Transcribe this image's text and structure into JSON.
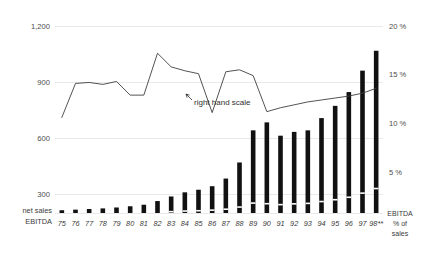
{
  "chart_data": {
    "type": "bar",
    "title": "",
    "subtitle": "",
    "xlabel": "",
    "ylabel": "",
    "grid": true,
    "legend_position": "inline-left-and-right",
    "categories": [
      "75",
      "76",
      "77",
      "78",
      "79",
      "80",
      "81",
      "82",
      "83",
      "84",
      "85",
      "86",
      "87",
      "88",
      "89",
      "90",
      "91",
      "92",
      "93",
      "94",
      "95",
      "96",
      "97",
      "98**"
    ],
    "left_axis": {
      "label": "net sales",
      "ticks": [
        "300",
        "600",
        "900",
        "1,200"
      ],
      "tick_values": [
        300,
        600,
        900,
        1200
      ],
      "ylim": [
        0,
        1300
      ]
    },
    "right_axis": {
      "label": "EBITDA % of sales",
      "label_lines": [
        "EBITDA",
        "% of",
        "sales"
      ],
      "ticks": [
        "5 %",
        "10 %",
        "15 %",
        "20 %"
      ],
      "tick_values": [
        5,
        10,
        15,
        20
      ],
      "ylim": [
        0,
        23
      ]
    },
    "series": [
      {
        "name": "net sales",
        "type": "bar",
        "axis": "left",
        "values": [
          18,
          22,
          26,
          30,
          36,
          44,
          54,
          78,
          108,
          135,
          152,
          175,
          225,
          330,
          540,
          592,
          505,
          530,
          540,
          620,
          700,
          790,
          930,
          1060
        ]
      },
      {
        "name": "EBITDA",
        "type": "bar-segment",
        "axis": "left",
        "values": [
          2,
          3,
          3,
          4,
          5,
          6,
          7,
          10,
          14,
          18,
          20,
          24,
          30,
          44,
          70,
          66,
          60,
          65,
          68,
          80,
          92,
          108,
          135,
          165
        ]
      },
      {
        "name": "EBITDA % of sales",
        "type": "line",
        "axis": "right",
        "annotation": "right hand scale",
        "values": [
          10.6,
          14.1,
          14.2,
          14.0,
          14.3,
          12.9,
          12.9,
          17.2,
          15.8,
          15.4,
          15.1,
          11.1,
          15.3,
          15.5,
          14.9,
          11.2,
          11.6,
          11.9,
          12.2,
          12.4,
          12.6,
          12.8,
          13.1,
          13.6
        ]
      }
    ],
    "annotation": {
      "text": "right hand scale"
    }
  },
  "labels": {
    "net_sales": "net sales",
    "ebitda": "EBITDA",
    "right_axis_line1": "EBITDA",
    "right_axis_line2": "% of",
    "right_axis_line3": "sales"
  }
}
